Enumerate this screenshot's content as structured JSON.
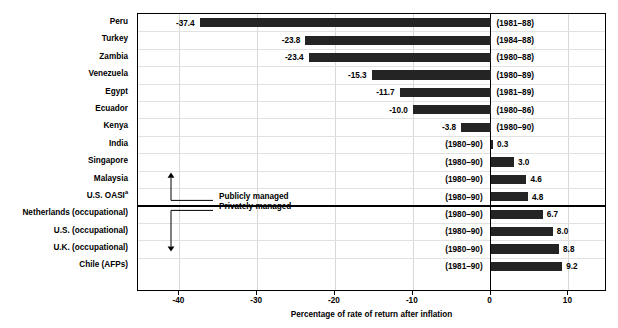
{
  "chart_data": {
    "type": "bar",
    "title": "",
    "xlabel": "Percentage of rate of return after inflation",
    "ylabel": "",
    "orientation": "horizontal",
    "xlim": [
      -45.4,
      15.2
    ],
    "xticks": [
      -40,
      -30,
      -20,
      -10,
      0,
      10
    ],
    "xticklabels": [
      "-40",
      "-30",
      "-20",
      "-10",
      "0",
      "10"
    ],
    "grid": "vertical gridlines at each x tick, light gray horizontal row separators",
    "legend": "none (inline arrow annotations instead)",
    "bar_color": "#242424",
    "categories": [
      "Peru",
      "Turkey",
      "Zambia",
      "Venezuela",
      "Egypt",
      "Ecuador",
      "Kenya",
      "India",
      "Singapore",
      "Malaysia",
      "U.S. OASI",
      "Netherlands (occupational)",
      "U.S. (occupational)",
      "U.K. (occupational)",
      "Chile (AFPs)"
    ],
    "values": [
      -37.4,
      -23.8,
      -23.4,
      -15.3,
      -11.7,
      -10.0,
      -3.8,
      0.3,
      3.0,
      4.6,
      4.8,
      6.7,
      8.0,
      8.8,
      9.2
    ],
    "value_labels": [
      "-37.4",
      "-23.8",
      "-23.4",
      "-15.3",
      "-11.7",
      "-10.0",
      "-3.8",
      "0.3",
      "3.0",
      "4.6",
      "4.8",
      "6.7",
      "8.0",
      "8.8",
      "9.2"
    ],
    "periods": [
      "(1981–88)",
      "(1984–88)",
      "(1980–88)",
      "(1980–89)",
      "(1981–89)",
      "(1980–86)",
      "(1980–90)",
      "(1980–90)",
      "(1980–90)",
      "(1980–90)",
      "(1980–90)",
      "(1980–90)",
      "(1980–90)",
      "(1980–90)",
      "(1981–90)"
    ],
    "rows": [
      {
        "category": "Peru",
        "value": -37.4,
        "value_label": "-37.4",
        "period": "(1981–88)",
        "group": "publicly-managed",
        "footnote": ""
      },
      {
        "category": "Turkey",
        "value": -23.8,
        "value_label": "-23.8",
        "period": "(1984–88)",
        "group": "publicly-managed",
        "footnote": ""
      },
      {
        "category": "Zambia",
        "value": -23.4,
        "value_label": "-23.4",
        "period": "(1980–88)",
        "group": "publicly-managed",
        "footnote": ""
      },
      {
        "category": "Venezuela",
        "value": -15.3,
        "value_label": "-15.3",
        "period": "(1980–89)",
        "group": "publicly-managed",
        "footnote": ""
      },
      {
        "category": "Egypt",
        "value": -11.7,
        "value_label": "-11.7",
        "period": "(1981–89)",
        "group": "publicly-managed",
        "footnote": ""
      },
      {
        "category": "Ecuador",
        "value": -10.0,
        "value_label": "-10.0",
        "period": "(1980–86)",
        "group": "publicly-managed",
        "footnote": ""
      },
      {
        "category": "Kenya",
        "value": -3.8,
        "value_label": "-3.8",
        "period": "(1980–90)",
        "group": "publicly-managed",
        "footnote": ""
      },
      {
        "category": "India",
        "value": 0.3,
        "value_label": "0.3",
        "period": "(1980–90)",
        "group": "publicly-managed",
        "footnote": ""
      },
      {
        "category": "Singapore",
        "value": 3.0,
        "value_label": "3.0",
        "period": "(1980–90)",
        "group": "publicly-managed",
        "footnote": ""
      },
      {
        "category": "Malaysia",
        "value": 4.6,
        "value_label": "4.6",
        "period": "(1980–90)",
        "group": "publicly-managed",
        "footnote": ""
      },
      {
        "category": "U.S. OASI",
        "value": 4.8,
        "value_label": "4.8",
        "period": "(1980–90)",
        "group": "publicly-managed",
        "footnote": "a"
      },
      {
        "category": "Netherlands (occupational)",
        "value": 6.7,
        "value_label": "6.7",
        "period": "(1980–90)",
        "group": "privately-managed",
        "footnote": ""
      },
      {
        "category": "U.S. (occupational)",
        "value": 8.0,
        "value_label": "8.0",
        "period": "(1980–90)",
        "group": "privately-managed",
        "footnote": ""
      },
      {
        "category": "U.K. (occupational)",
        "value": 8.8,
        "value_label": "8.8",
        "period": "(1980–90)",
        "group": "privately-managed",
        "footnote": ""
      },
      {
        "category": "Chile (AFPs)",
        "value": 9.2,
        "value_label": "9.2",
        "period": "(1981–90)",
        "group": "privately-managed",
        "footnote": ""
      }
    ],
    "annotations": [
      {
        "name": "publicly-managed",
        "text": "Publicly managed",
        "arrow": "up"
      },
      {
        "name": "privately-managed",
        "text": "Privately managed",
        "arrow": "down"
      }
    ]
  }
}
